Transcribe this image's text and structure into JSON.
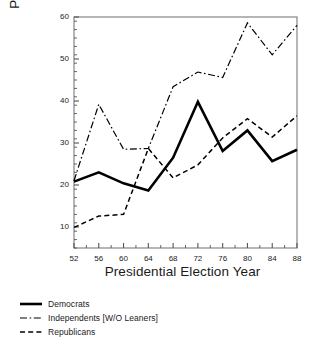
{
  "chart_data": {
    "type": "line",
    "title": "",
    "xlabel": "Presidential Election Year",
    "ylabel": "Percent Splitting Ticket",
    "x": [
      52,
      56,
      60,
      64,
      68,
      72,
      76,
      80,
      84,
      88
    ],
    "xtick_labels": [
      "52",
      "56",
      "60",
      "64",
      "68",
      "72",
      "76",
      "80",
      "84",
      "88"
    ],
    "ytick_labels": [
      "10",
      "20",
      "30",
      "40",
      "50",
      "60"
    ],
    "yticks": [
      10,
      20,
      30,
      40,
      50,
      60
    ],
    "xlim": [
      52,
      88
    ],
    "ylim": [
      5,
      60
    ],
    "grid": false,
    "legend_position": "below-left",
    "series": [
      {
        "name": "Democrats",
        "style": "solid",
        "color": "#000000",
        "width": 2.6,
        "values": [
          20.8,
          23.0,
          20.4,
          18.7,
          26.5,
          39.8,
          28.1,
          33.0,
          25.7,
          28.4
        ]
      },
      {
        "name": "Independents [W/O Leaners]",
        "style": "dash-dot",
        "color": "#000000",
        "width": 1.2,
        "values": [
          21.0,
          39.2,
          28.5,
          28.7,
          43.4,
          46.9,
          45.6,
          58.6,
          51.0,
          58.0
        ]
      },
      {
        "name": "Republicans",
        "style": "dashed",
        "color": "#000000",
        "width": 1.5,
        "values": [
          9.9,
          12.6,
          13.0,
          28.7,
          21.7,
          24.8,
          31.2,
          35.8,
          31.4,
          36.5
        ]
      }
    ]
  },
  "legend": {
    "items": [
      {
        "label": "Democrats",
        "style": "solid"
      },
      {
        "label": "Independents [W/O Leaners]",
        "style": "dash-dot"
      },
      {
        "label": "Republicans",
        "style": "dashed"
      }
    ]
  },
  "axes": {
    "frame_color": "#7a7a7a",
    "tick_color": "#555555"
  }
}
